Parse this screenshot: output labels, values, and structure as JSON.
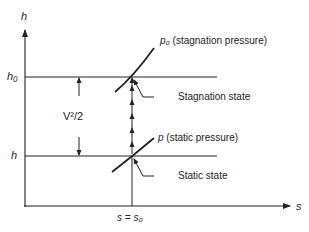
{
  "diagram": {
    "type": "h-s diagram (enthalpy vs entropy)",
    "axes": {
      "y_label": "h",
      "x_label": "s"
    },
    "levels": {
      "stagnation_enthalpy": "h₀",
      "static_enthalpy": "h"
    },
    "curves": {
      "stagnation_pressure": {
        "symbol": "p₀",
        "description": "(stagnation pressure)"
      },
      "static_pressure": {
        "symbol": "p",
        "description": "(static pressure)"
      }
    },
    "annotations": {
      "kinetic_energy": "V²/2",
      "stagnation_state": "Stagnation state",
      "static_state": "Static state",
      "entropy_equal": "s = s₀"
    }
  },
  "colors": {
    "line": "#222222",
    "background": "#ffffff"
  }
}
